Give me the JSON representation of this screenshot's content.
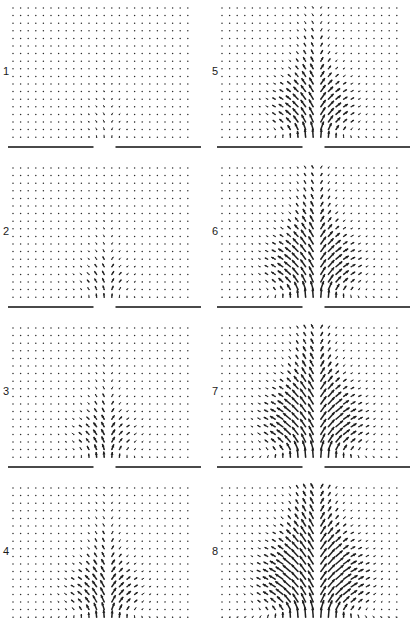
{
  "figure": {
    "type": "vector-field-panel-grid",
    "columns": 2,
    "rows": 4,
    "panel_count": 8
  },
  "panels": [
    {
      "id": "panel-1",
      "label": "1",
      "column": "left",
      "row": 1,
      "strength": 0.3,
      "spread": 0.26,
      "reach": 0.3
    },
    {
      "id": "panel-2",
      "label": "2",
      "column": "left",
      "row": 2,
      "strength": 0.45,
      "spread": 0.4,
      "reach": 0.4
    },
    {
      "id": "panel-3",
      "label": "3",
      "column": "left",
      "row": 3,
      "strength": 0.58,
      "spread": 0.52,
      "reach": 0.5
    },
    {
      "id": "panel-4",
      "label": "4",
      "column": "left",
      "row": 4,
      "strength": 0.7,
      "spread": 0.62,
      "reach": 0.6
    },
    {
      "id": "panel-5",
      "label": "5",
      "column": "right",
      "row": 1,
      "strength": 0.8,
      "spread": 0.72,
      "reach": 0.68
    },
    {
      "id": "panel-6",
      "label": "6",
      "column": "right",
      "row": 2,
      "strength": 0.88,
      "spread": 0.82,
      "reach": 0.76
    },
    {
      "id": "panel-7",
      "label": "7",
      "column": "right",
      "row": 3,
      "strength": 0.95,
      "spread": 0.92,
      "reach": 0.86
    },
    {
      "id": "panel-8",
      "label": "8",
      "column": "right",
      "row": 4,
      "strength": 1.0,
      "spread": 1.0,
      "reach": 0.95
    }
  ],
  "grid": {
    "nx": 24,
    "ny": 18,
    "spacing_px": 7.6,
    "origin_x_px": 13,
    "origin_y_px": 8,
    "dot_radius_px": 0.75
  },
  "aperture": {
    "label": "slot",
    "gap_center_fraction": 0.5,
    "gap_half_width_px": 11,
    "wall_thickness_px": 2,
    "wall_color": "#4a4a4a",
    "left_wall_start_px": 8,
    "right_wall_end_px": 201
  },
  "colors": {
    "background": "#ffffff",
    "dot": "#2b2b2b",
    "arrow": "#1f1f1f",
    "wall": "#4a4a4a",
    "label": "#1a1a1a"
  },
  "chart_data": {
    "type": "scatter",
    "title": "",
    "xlabel": "",
    "ylabel": "",
    "series": [
      {
        "name": "panel-1",
        "label": "1",
        "max_arrow_length_px": 6.0,
        "jet_core_direction_deg": 90,
        "note": "Weak narrow jet confined just above the slot; outer field nearly quiescent."
      },
      {
        "name": "panel-2",
        "label": "2",
        "max_arrow_length_px": 7.0,
        "jet_core_direction_deg": 90,
        "note": "Jet taller, entrainment arrows begin tilting inward along the wall."
      },
      {
        "name": "panel-3",
        "label": "3",
        "max_arrow_length_px": 7.5,
        "jet_core_direction_deg": 90,
        "note": "Jet column extends two grid rows higher; side vortices forming."
      },
      {
        "name": "panel-4",
        "label": "4",
        "max_arrow_length_px": 8.0,
        "jet_core_direction_deg": 90,
        "note": "Symmetric entrainment fans on both sides of the slot."
      },
      {
        "name": "panel-5",
        "label": "5",
        "max_arrow_length_px": 8.5,
        "jet_core_direction_deg": 90,
        "note": "Broad mushroom-shaped field; wall-parallel inflow well established."
      },
      {
        "name": "panel-6",
        "label": "6",
        "max_arrow_length_px": 9.0,
        "jet_core_direction_deg": 90,
        "note": "Jet and recirculation occupy the lower half of the domain."
      },
      {
        "name": "panel-7",
        "label": "7",
        "max_arrow_length_px": 9.5,
        "jet_core_direction_deg": 90,
        "note": "Largest coherent structure; outward splay reaches the side boundaries."
      },
      {
        "name": "panel-8",
        "label": "8",
        "max_arrow_length_px": 10.0,
        "jet_core_direction_deg": 90,
        "note": "Fully developed field, with converging downward arrows at the slot lips."
      }
    ],
    "grid_on": false,
    "legend_position": "none"
  }
}
